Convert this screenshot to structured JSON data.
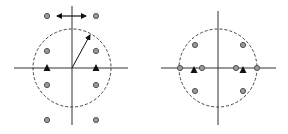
{
  "colors": {
    "background": "#ffffff",
    "line": "#333333",
    "dot_fill": "#9a9a9a",
    "dot_stroke": "#555555",
    "triangle": "#111111"
  },
  "diagrams": [
    {
      "name": "left-constellation",
      "center": [
        72,
        68
      ],
      "radius": 39,
      "h_axis": [
        14,
        128
      ],
      "v_axis": [
        6,
        125
      ],
      "dots": [
        [
          47,
          16
        ],
        [
          96,
          16
        ],
        [
          47,
          51
        ],
        [
          96,
          51
        ],
        [
          47,
          85
        ],
        [
          96,
          85
        ],
        [
          47,
          120
        ],
        [
          96,
          120
        ]
      ],
      "triangles": [
        [
          47,
          68
        ],
        [
          96,
          68
        ]
      ],
      "double_arrow": {
        "y": 16,
        "x1": 57,
        "x2": 86
      },
      "radius_arrow": {
        "from": [
          72,
          68
        ],
        "to": [
          90,
          35
        ]
      }
    },
    {
      "name": "right-constellation",
      "center": [
        218,
        68
      ],
      "radius": 39,
      "h_axis": [
        161,
        276
      ],
      "v_axis": [
        11,
        125
      ],
      "dots": [
        [
          195,
          45
        ],
        [
          243,
          45
        ],
        [
          180,
          68
        ],
        [
          202,
          68
        ],
        [
          236,
          68
        ],
        [
          257,
          68
        ],
        [
          195,
          91
        ],
        [
          243,
          91
        ]
      ],
      "triangles": [
        [
          194,
          70
        ],
        [
          243,
          70
        ]
      ]
    }
  ]
}
